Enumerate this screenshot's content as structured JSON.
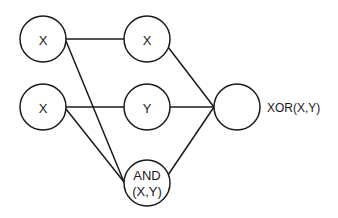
{
  "diagram": {
    "nodes": [
      {
        "id": "in_x1",
        "label": "X",
        "cx": 43,
        "cy": 39,
        "r": 23
      },
      {
        "id": "in_x2",
        "label": "X",
        "cx": 43,
        "cy": 107,
        "r": 23
      },
      {
        "id": "hid_x",
        "label": "X",
        "cx": 147,
        "cy": 39,
        "r": 23
      },
      {
        "id": "hid_y",
        "label": "Y",
        "cx": 147,
        "cy": 107,
        "r": 23
      },
      {
        "id": "hid_and",
        "label_line1": "AND",
        "label_line2": "(X,Y)",
        "cx": 147,
        "cy": 183,
        "r": 23
      },
      {
        "id": "out",
        "label": "",
        "cx": 237,
        "cy": 107,
        "r": 23
      }
    ],
    "output_label": "XOR(X,Y)",
    "edges": [
      {
        "from": "in_x1",
        "to": "hid_x"
      },
      {
        "from": "in_x1",
        "to": "hid_and"
      },
      {
        "from": "in_x2",
        "to": "hid_y"
      },
      {
        "from": "in_x2",
        "to": "hid_and"
      },
      {
        "from": "hid_x",
        "to": "out"
      },
      {
        "from": "hid_y",
        "to": "out"
      },
      {
        "from": "hid_and",
        "to": "out"
      }
    ],
    "colors": {
      "stroke": "#1a1a1a",
      "background": "#ffffff"
    }
  }
}
